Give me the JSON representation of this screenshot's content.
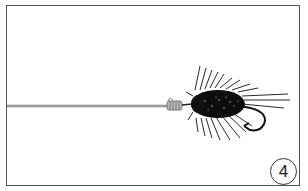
{
  "diagram": {
    "step_number": "4",
    "colors": {
      "frame": "#555555",
      "line": "#8a8a8a",
      "knot": "#9a9a9a",
      "fly": "#111111",
      "background": "#ffffff"
    }
  }
}
